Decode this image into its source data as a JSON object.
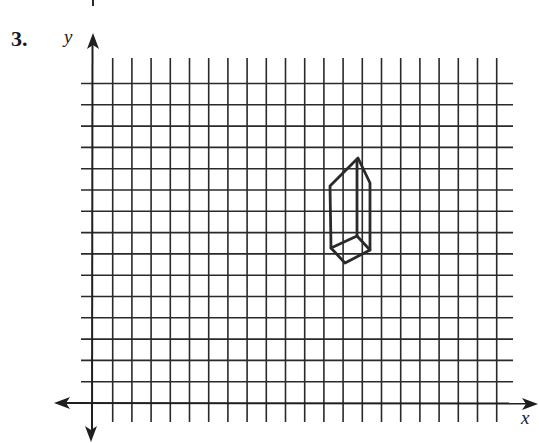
{
  "problem": {
    "number_label": "3."
  },
  "axes": {
    "x_label": "x",
    "y_label": "y",
    "origin_px": [
      93,
      403
    ]
  },
  "grid": {
    "vertical_lines": 21,
    "horizontal_lines": 15,
    "col_spacing_px": 19.2,
    "row_spacing_px": 21.3,
    "line_color": "#2a2a2a"
  },
  "shape": {
    "type": "rectangular-prism",
    "description": "Tall prism drawn in oblique projection",
    "stroke_color": "#2a2a2a",
    "vertices_px": {
      "top": [
        358,
        158
      ],
      "left_shoulder": [
        330,
        186
      ],
      "right_shoulder": [
        370,
        183
      ],
      "inner_top": [
        357,
        161
      ],
      "bottom_left": [
        331,
        248
      ],
      "bottom": [
        345,
        263
      ],
      "bottom_right": [
        370,
        250
      ],
      "inner_bottom": [
        357,
        236
      ]
    }
  }
}
